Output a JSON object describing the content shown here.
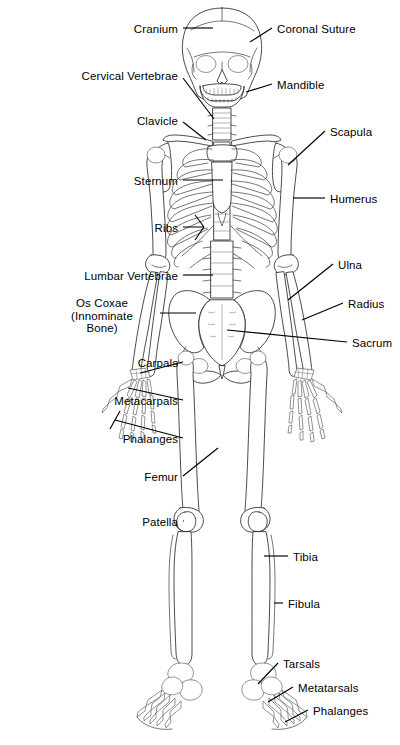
{
  "document": {
    "title": "Human Skeleton Anatomical Diagram",
    "view": "anterior",
    "background_color": "#ffffff",
    "line_color": "#2b2b2b",
    "label_color": "#000000"
  },
  "labels_left": [
    {
      "id": "cranium",
      "text": "Cranium",
      "x": 178,
      "y": 23,
      "align": "right"
    },
    {
      "id": "cervical-vertebrae",
      "text": "Cervical Vertebrae",
      "x": 178,
      "y": 70,
      "align": "right"
    },
    {
      "id": "clavicle",
      "text": "Clavicle",
      "x": 178,
      "y": 115,
      "align": "right"
    },
    {
      "id": "sternum",
      "text": "Sternum",
      "x": 178,
      "y": 175,
      "align": "right"
    },
    {
      "id": "ribs",
      "text": "Ribs",
      "x": 178,
      "y": 222,
      "align": "right"
    },
    {
      "id": "lumbar-vertebrae",
      "text": "Lumbar Vertebrae",
      "x": 178,
      "y": 270,
      "align": "right"
    },
    {
      "id": "carpals",
      "text": "Carpals",
      "x": 178,
      "y": 357,
      "align": "right"
    },
    {
      "id": "metacarpals",
      "text": "Metacarpals",
      "x": 178,
      "y": 395,
      "align": "right"
    },
    {
      "id": "phalanges-hand",
      "text": "Phalanges",
      "x": 178,
      "y": 433,
      "align": "right"
    },
    {
      "id": "femur",
      "text": "Femur",
      "x": 178,
      "y": 471,
      "align": "right"
    },
    {
      "id": "patella",
      "text": "Patella",
      "x": 178,
      "y": 516,
      "align": "right"
    }
  ],
  "label_os_coxae": {
    "id": "os-coxae",
    "line1": "Os Coxae",
    "line2": "(Innominate",
    "line3": "Bone)",
    "x": 102,
    "y": 297
  },
  "labels_right": [
    {
      "id": "coronal-suture",
      "text": "Coronal Suture",
      "x": 277,
      "y": 23,
      "align": "left"
    },
    {
      "id": "mandible",
      "text": "Mandible",
      "x": 277,
      "y": 79,
      "align": "left"
    },
    {
      "id": "scapula",
      "text": "Scapula",
      "x": 330,
      "y": 126,
      "align": "left"
    },
    {
      "id": "humerus",
      "text": "Humerus",
      "x": 330,
      "y": 193,
      "align": "left"
    },
    {
      "id": "ulna",
      "text": "Ulna",
      "x": 338,
      "y": 259,
      "align": "left"
    },
    {
      "id": "radius",
      "text": "Radius",
      "x": 348,
      "y": 298,
      "align": "left"
    },
    {
      "id": "sacrum",
      "text": "Sacrum",
      "x": 352,
      "y": 337,
      "align": "left"
    },
    {
      "id": "tibia",
      "text": "Tibia",
      "x": 293,
      "y": 551,
      "align": "left"
    },
    {
      "id": "fibula",
      "text": "Fibula",
      "x": 288,
      "y": 598,
      "align": "left"
    },
    {
      "id": "tarsals",
      "text": "Tarsals",
      "x": 283,
      "y": 658,
      "align": "left"
    },
    {
      "id": "metatarsals",
      "text": "Metatarsals",
      "x": 298,
      "y": 682,
      "align": "left"
    },
    {
      "id": "phalanges-foot",
      "text": "Phalanges",
      "x": 313,
      "y": 705,
      "align": "left"
    }
  ],
  "bone_groups": [
    "skull",
    "mandible",
    "cervical-vertebrae",
    "clavicle",
    "scapula",
    "sternum",
    "ribs",
    "humerus",
    "radius",
    "ulna",
    "carpals",
    "metacarpals",
    "hand-phalanges",
    "lumbar-vertebrae",
    "os-coxae",
    "sacrum",
    "femur",
    "patella",
    "tibia",
    "fibula",
    "tarsals",
    "metatarsals",
    "foot-phalanges"
  ]
}
